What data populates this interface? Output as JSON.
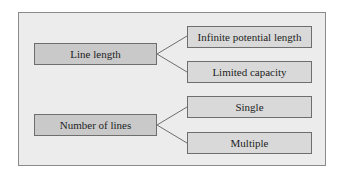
{
  "diagram": {
    "type": "tree",
    "colors": {
      "background": "#ececec",
      "frame_border": "#8a8a8a",
      "parent_fill": "#c9c9c9",
      "child_fill": "#d9d9d9",
      "line": "#6e6e6e"
    },
    "groups": [
      {
        "label": "Line length",
        "children": [
          {
            "label": "Infinite potential length"
          },
          {
            "label": "Limited capacity"
          }
        ]
      },
      {
        "label": "Number of lines",
        "children": [
          {
            "label": "Single"
          },
          {
            "label": "Multiple"
          }
        ]
      }
    ]
  }
}
